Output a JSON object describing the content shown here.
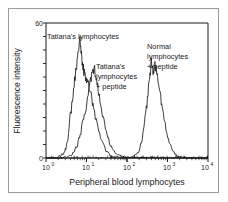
{
  "figure": {
    "background_color": "#ffffff",
    "frame_color": "#9b9b9b",
    "line_color": "#1a1a1a"
  },
  "chart_data": {
    "type": "line",
    "title": "",
    "subtitle": "",
    "xlabel": "Peripheral blood lymphocytes",
    "ylabel": "Fluorescence intensity",
    "xscale": "log",
    "xlim": [
      1,
      10000
    ],
    "ylim": [
      0,
      60
    ],
    "grid": false,
    "legend_position": "inline-annotations",
    "x_tick_labels": [
      "10",
      "10",
      "10",
      "10",
      "10"
    ],
    "x_tick_exponents": [
      "0",
      "1",
      "2",
      "3",
      "4"
    ],
    "x_tick_values": [
      1,
      10,
      100,
      1000,
      10000
    ],
    "y_tick_labels": [
      "0",
      "60"
    ],
    "y_tick_values": [
      0,
      60
    ],
    "y_minor_tick_count": 11,
    "annotations": [
      {
        "id": "anno-tatiana-lymphocytes",
        "lines": [
          "Tatiana's lymphocytes"
        ]
      },
      {
        "id": "anno-tatiana-peptide",
        "lines": [
          "Tatiana's",
          "lymphocytes",
          "+ peptide"
        ]
      },
      {
        "id": "anno-normal-peptide",
        "lines": [
          "Normal",
          "lymphocytes",
          "+ peptide"
        ]
      }
    ],
    "series": [
      {
        "name": "Tatiana's lymphocytes",
        "peak_x": 7,
        "peak_y": 52,
        "points": [
          [
            1.9,
            0
          ],
          [
            2.1,
            1
          ],
          [
            2.3,
            0.6
          ],
          [
            2.5,
            2
          ],
          [
            2.7,
            1.4
          ],
          [
            2.9,
            3
          ],
          [
            3.1,
            4.6
          ],
          [
            3.3,
            6
          ],
          [
            3.5,
            9
          ],
          [
            3.7,
            13
          ],
          [
            3.9,
            17
          ],
          [
            4.2,
            21
          ],
          [
            4.5,
            26
          ],
          [
            4.8,
            30
          ],
          [
            5.1,
            34
          ],
          [
            5.4,
            38
          ],
          [
            5.7,
            41
          ],
          [
            6.0,
            45
          ],
          [
            6.3,
            47
          ],
          [
            6.6,
            50
          ],
          [
            6.9,
            52
          ],
          [
            7.2,
            50
          ],
          [
            7.5,
            46
          ],
          [
            7.8,
            43
          ],
          [
            8.2,
            41
          ],
          [
            8.6,
            39
          ],
          [
            9.0,
            37
          ],
          [
            9.5,
            36
          ],
          [
            10,
            34
          ],
          [
            10.6,
            33
          ],
          [
            11.2,
            32
          ],
          [
            12,
            30
          ],
          [
            13,
            27
          ],
          [
            14,
            24
          ],
          [
            15,
            21
          ],
          [
            16.5,
            18
          ],
          [
            18,
            15
          ],
          [
            20,
            12
          ],
          [
            22,
            9
          ],
          [
            24,
            7
          ],
          [
            27,
            5
          ],
          [
            30,
            3.5
          ],
          [
            34,
            2.2
          ],
          [
            38,
            1.4
          ],
          [
            44,
            0.9
          ],
          [
            52,
            0.5
          ],
          [
            62,
            0.3
          ],
          [
            75,
            0.2
          ],
          [
            95,
            0.1
          ]
        ]
      },
      {
        "name": "Tatiana's lymphocytes + peptide",
        "peak_x": 14,
        "peak_y": 40,
        "points": [
          [
            2.6,
            0
          ],
          [
            3.0,
            0.5
          ],
          [
            3.4,
            0.3
          ],
          [
            3.8,
            1.2
          ],
          [
            4.2,
            1
          ],
          [
            4.6,
            2
          ],
          [
            5.0,
            3
          ],
          [
            5.5,
            4.5
          ],
          [
            6.0,
            6
          ],
          [
            6.5,
            8
          ],
          [
            7.0,
            10
          ],
          [
            7.6,
            13
          ],
          [
            8.2,
            16
          ],
          [
            8.8,
            19
          ],
          [
            9.5,
            22
          ],
          [
            10.2,
            25
          ],
          [
            11,
            28
          ],
          [
            11.8,
            31
          ],
          [
            12.6,
            34
          ],
          [
            13.4,
            37
          ],
          [
            14.2,
            40
          ],
          [
            15,
            38
          ],
          [
            15.9,
            39
          ],
          [
            16.8,
            36
          ],
          [
            17.8,
            34
          ],
          [
            18.8,
            31
          ],
          [
            20,
            28
          ],
          [
            21.5,
            25
          ],
          [
            23,
            22
          ],
          [
            25,
            19
          ],
          [
            27,
            16
          ],
          [
            29.5,
            13
          ],
          [
            32,
            10.5
          ],
          [
            35,
            8
          ],
          [
            39,
            6
          ],
          [
            43,
            4.5
          ],
          [
            48,
            3
          ],
          [
            54,
            2
          ],
          [
            62,
            1.3
          ],
          [
            72,
            0.8
          ],
          [
            85,
            0.5
          ],
          [
            100,
            0.3
          ],
          [
            120,
            0.2
          ]
        ]
      },
      {
        "name": "Normal lymphocytes + peptide",
        "peak_x": 450,
        "peak_y": 42,
        "points": [
          [
            120,
            0
          ],
          [
            140,
            0.6
          ],
          [
            160,
            1.2
          ],
          [
            180,
            2
          ],
          [
            200,
            3.5
          ],
          [
            220,
            6
          ],
          [
            240,
            9
          ],
          [
            260,
            13
          ],
          [
            280,
            17
          ],
          [
            300,
            21
          ],
          [
            320,
            26
          ],
          [
            340,
            31
          ],
          [
            360,
            35
          ],
          [
            380,
            39
          ],
          [
            400,
            42
          ],
          [
            420,
            40
          ],
          [
            440,
            38
          ],
          [
            460,
            40
          ],
          [
            480,
            42
          ],
          [
            500,
            41
          ],
          [
            520,
            39
          ],
          [
            545,
            37
          ],
          [
            570,
            35
          ],
          [
            600,
            32
          ],
          [
            640,
            29
          ],
          [
            680,
            26
          ],
          [
            720,
            23
          ],
          [
            770,
            20
          ],
          [
            820,
            17
          ],
          [
            880,
            14
          ],
          [
            950,
            11
          ],
          [
            1020,
            9
          ],
          [
            1100,
            7
          ],
          [
            1200,
            5
          ],
          [
            1320,
            3.5
          ],
          [
            1450,
            2.4
          ],
          [
            1600,
            1.6
          ],
          [
            1800,
            1
          ],
          [
            2000,
            0.7
          ],
          [
            2400,
            0.4
          ],
          [
            3000,
            0.3
          ]
        ]
      }
    ]
  },
  "labels": {
    "y_axis_title": "Fluorescence intensity",
    "x_axis_title": "Peripheral blood lymphocytes",
    "y_top": "60",
    "y_bottom": "0",
    "x_t0_base": "10",
    "x_t0_exp": "0",
    "x_t1_base": "10",
    "x_t1_exp": "1",
    "x_t2_base": "10",
    "x_t2_exp": "2",
    "x_t3_base": "10",
    "x_t3_exp": "3",
    "x_t4_base": "10",
    "x_t4_exp": "4",
    "anno1_l1": "Tatiana's lymphocytes",
    "anno2_l1": "Tatiana's",
    "anno2_l2": "lymphocytes",
    "anno2_l3": "+ peptide",
    "anno3_l1": "Normal",
    "anno3_l2": "lymphocytes",
    "anno3_l3": "+ peptide"
  }
}
